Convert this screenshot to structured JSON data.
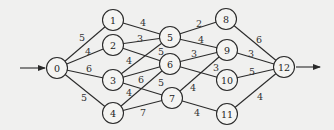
{
  "diagram": {
    "type": "directed-weighted-graph",
    "source_node": "0",
    "sink_node": "12",
    "nodes": [
      {
        "id": "0",
        "label": "0",
        "x": 57,
        "y": 68
      },
      {
        "id": "1",
        "label": "1",
        "x": 113,
        "y": 20
      },
      {
        "id": "2",
        "label": "2",
        "x": 113,
        "y": 45
      },
      {
        "id": "3",
        "label": "3",
        "x": 113,
        "y": 80
      },
      {
        "id": "4",
        "label": "4",
        "x": 113,
        "y": 113
      },
      {
        "id": "5",
        "label": "5",
        "x": 170,
        "y": 37
      },
      {
        "id": "6",
        "label": "6",
        "x": 170,
        "y": 64
      },
      {
        "id": "7",
        "label": "7",
        "x": 172,
        "y": 98
      },
      {
        "id": "8",
        "label": "8",
        "x": 226,
        "y": 19
      },
      {
        "id": "9",
        "label": "9",
        "x": 227,
        "y": 50
      },
      {
        "id": "10",
        "label": "10",
        "x": 227,
        "y": 80
      },
      {
        "id": "11",
        "label": "11",
        "x": 227,
        "y": 114
      },
      {
        "id": "12",
        "label": "12",
        "x": 284,
        "y": 67
      }
    ],
    "edges": [
      {
        "from": "0",
        "to": "1",
        "weight": "5",
        "lx": 82,
        "ly": 37
      },
      {
        "from": "0",
        "to": "2",
        "weight": "4",
        "lx": 88,
        "ly": 51
      },
      {
        "from": "0",
        "to": "3",
        "weight": "6",
        "lx": 89,
        "ly": 68
      },
      {
        "from": "0",
        "to": "4",
        "weight": "5",
        "lx": 84,
        "ly": 97
      },
      {
        "from": "1",
        "to": "5",
        "weight": "4",
        "lx": 143,
        "ly": 22
      },
      {
        "from": "2",
        "to": "5",
        "weight": "3",
        "lx": 140,
        "ly": 38
      },
      {
        "from": "2",
        "to": "6",
        "weight": "4",
        "lx": 129,
        "ly": 60
      },
      {
        "from": "3",
        "to": "5",
        "weight": "5",
        "lx": 161,
        "ly": 51
      },
      {
        "from": "3",
        "to": "6",
        "weight": "6",
        "lx": 141,
        "ly": 79
      },
      {
        "from": "3",
        "to": "7",
        "weight": "4",
        "lx": 129,
        "ly": 92
      },
      {
        "from": "4",
        "to": "6",
        "weight": "5",
        "lx": 161,
        "ly": 82
      },
      {
        "from": "4",
        "to": "7",
        "weight": "7",
        "lx": 143,
        "ly": 112
      },
      {
        "from": "5",
        "to": "8",
        "weight": "2",
        "lx": 199,
        "ly": 23
      },
      {
        "from": "5",
        "to": "9",
        "weight": "4",
        "lx": 201,
        "ly": 39
      },
      {
        "from": "6",
        "to": "9",
        "weight": "3",
        "lx": 194,
        "ly": 53
      },
      {
        "from": "6",
        "to": "10",
        "weight": "3",
        "lx": 216,
        "ly": 67
      },
      {
        "from": "7",
        "to": "9",
        "weight": "4",
        "lx": 193,
        "ly": 87
      },
      {
        "from": "7",
        "to": "11",
        "weight": "4",
        "lx": 197,
        "ly": 112
      },
      {
        "from": "8",
        "to": "12",
        "weight": "6",
        "lx": 259,
        "ly": 39
      },
      {
        "from": "9",
        "to": "12",
        "weight": "3",
        "lx": 251,
        "ly": 53
      },
      {
        "from": "10",
        "to": "12",
        "weight": "5",
        "lx": 252,
        "ly": 71
      },
      {
        "from": "11",
        "to": "12",
        "weight": "4",
        "lx": 260,
        "ly": 96
      }
    ],
    "entry_arrow": {
      "x1": 20,
      "y1": 68,
      "x2": 45,
      "y2": 68
    },
    "exit_arrow": {
      "x1": 296,
      "y1": 67,
      "x2": 320,
      "y2": 67
    },
    "colors": {
      "line": "#2a2a2a",
      "background": "#f0f0ef",
      "node_fill": "#f4f4f2"
    }
  }
}
